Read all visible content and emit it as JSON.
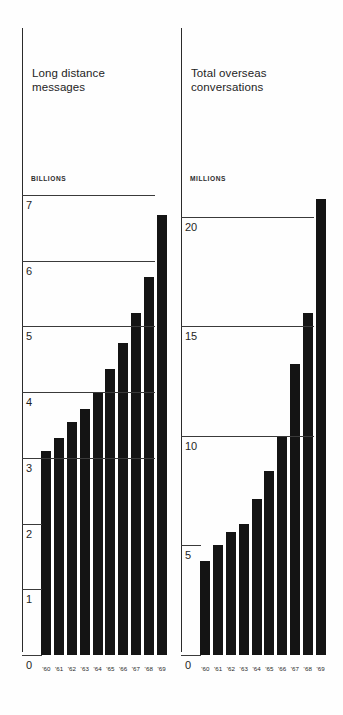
{
  "chart_data": [
    {
      "type": "bar",
      "title": "Long distance\nmessages",
      "unit_label": "BILLIONS",
      "xlabel": "",
      "ylabel": "BILLIONS",
      "categories": [
        "'60",
        "'61",
        "'62",
        "'63",
        "'64",
        "'65",
        "'66",
        "'67",
        "'68",
        "'69"
      ],
      "values": [
        3.1,
        3.3,
        3.55,
        3.75,
        4.0,
        4.35,
        4.75,
        5.2,
        5.75,
        6.7
      ],
      "ylim": [
        0,
        7
      ],
      "yticks": [
        0,
        1,
        2,
        3,
        4,
        5,
        6,
        7
      ],
      "ytick_labels": [
        "0",
        "1",
        "2",
        "3",
        "4",
        "5",
        "6",
        "7"
      ],
      "major_gridlines": [
        3,
        4,
        5,
        6,
        7
      ],
      "minor_gridlines": [
        0,
        1,
        2
      ],
      "grid": true,
      "legend": "none",
      "bar_color": "#141414"
    },
    {
      "type": "bar",
      "title": "Total overseas\nconversations",
      "unit_label": "MILLIONS",
      "xlabel": "",
      "ylabel": "MILLIONS",
      "categories": [
        "'60",
        "'61",
        "'62",
        "'63",
        "'64",
        "'65",
        "'66",
        "'67",
        "'68",
        "'69"
      ],
      "values": [
        4.3,
        5.0,
        5.6,
        6.0,
        7.1,
        8.4,
        10.0,
        13.3,
        15.6,
        20.8
      ],
      "ylim": [
        0,
        21
      ],
      "yticks": [
        0,
        5,
        10,
        15,
        20
      ],
      "ytick_labels": [
        "0",
        "5",
        "10",
        "15",
        "20"
      ],
      "major_gridlines": [
        10,
        15,
        20
      ],
      "minor_gridlines": [
        0,
        5
      ],
      "grid": true,
      "legend": "none",
      "bar_color": "#141414"
    }
  ],
  "panels": [
    {
      "title": "Long distance\nmessages",
      "unit_label": "BILLIONS",
      "tick_labels": [
        "7",
        "6",
        "5",
        "4",
        "3",
        "2",
        "1",
        "0"
      ],
      "x_labels": [
        "'60",
        "'61",
        "'62",
        "'63",
        "'64",
        "'65",
        "'66",
        "'67",
        "'68",
        "'69"
      ]
    },
    {
      "title": "Total overseas\nconversations",
      "unit_label": "MILLIONS",
      "tick_labels": [
        "20",
        "15",
        "10",
        "5",
        "0"
      ],
      "x_labels": [
        "'60",
        "'61",
        "'62",
        "'63",
        "'64",
        "'65",
        "'66",
        "'67",
        "'68",
        "'69"
      ]
    }
  ],
  "colors": {
    "bar": "#141414",
    "axis": "#2b2b2b",
    "grid": "#3a3a3a",
    "background": "#fefefe",
    "text": "#1f1f1f"
  }
}
